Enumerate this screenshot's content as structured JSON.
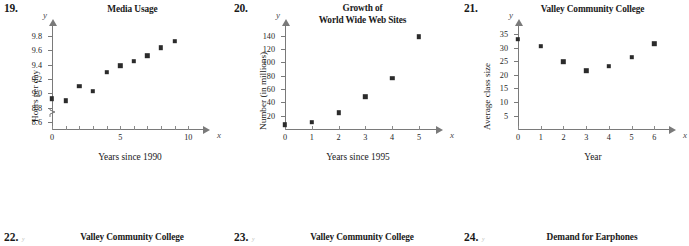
{
  "page": {
    "background": "#ffffff",
    "marker_color": "#2b2b2b",
    "axis_color": "#7a7a7a"
  },
  "problems": [
    {
      "number": "19.",
      "title_lines": [
        "Media Usage"
      ],
      "axis_x_letter": "x",
      "axis_y_letter": "y",
      "chart_data": {
        "type": "scatter",
        "title": "Media Usage",
        "xlabel": "Years since 1990",
        "ylabel": "Hours per day",
        "xlim": [
          0,
          11
        ],
        "ylim": [
          8.5,
          9.9
        ],
        "y_axis_break": true,
        "grid": false,
        "legend": "none",
        "xticks": [
          0,
          1,
          2,
          3,
          4,
          5,
          6,
          7,
          8,
          9,
          10
        ],
        "xtick_labels": [
          "0",
          "",
          "",
          "",
          "",
          "5",
          "",
          "",
          "",
          "",
          "10"
        ],
        "yticks": [
          8.6,
          8.8,
          9.0,
          9.2,
          9.4,
          9.6,
          9.8
        ],
        "ytick_labels": [
          "8.6",
          "8.8",
          "9.0",
          "9.2",
          "9.4",
          "9.6",
          "9.8"
        ],
        "x": [
          0,
          1,
          2,
          3,
          4,
          5,
          6,
          7,
          8,
          9
        ],
        "y": [
          8.94,
          8.91,
          9.11,
          9.04,
          9.31,
          9.4,
          9.46,
          9.54,
          9.65,
          9.74
        ]
      }
    },
    {
      "number": "20.",
      "title_lines": [
        "Growth of",
        "World Wide Web Sites"
      ],
      "axis_x_letter": "x",
      "axis_y_letter": "y",
      "chart_data": {
        "type": "scatter",
        "title": "Growth of World Wide Web Sites",
        "xlabel": "Years since 1995",
        "ylabel": "Number (in millions)",
        "xlim": [
          0,
          5.6
        ],
        "ylim": [
          0,
          150
        ],
        "y_axis_break": false,
        "grid": false,
        "legend": "none",
        "xticks": [
          0,
          1,
          2,
          3,
          4,
          5
        ],
        "xtick_labels": [
          "0",
          "1",
          "2",
          "3",
          "4",
          "5"
        ],
        "yticks": [
          20,
          40,
          60,
          80,
          100,
          120,
          140
        ],
        "ytick_labels": [
          "20",
          "40",
          "60",
          "80",
          "100",
          "120",
          "140"
        ],
        "x": [
          0,
          1,
          2,
          3,
          4,
          5
        ],
        "y": [
          8,
          12,
          26,
          50,
          78,
          140
        ]
      }
    },
    {
      "number": "21.",
      "title_lines": [
        "Valley Community College"
      ],
      "axis_x_letter": "x",
      "axis_y_letter": "y",
      "chart_data": {
        "type": "scatter",
        "title": "Valley Community College",
        "xlabel": "Year",
        "ylabel": "Average class size",
        "xlim": [
          0,
          6.6
        ],
        "ylim": [
          0,
          37
        ],
        "y_axis_break": false,
        "grid": false,
        "legend": "none",
        "xticks": [
          0,
          1,
          2,
          3,
          4,
          5,
          6
        ],
        "xtick_labels": [
          "0",
          "1",
          "2",
          "3",
          "4",
          "5",
          "6"
        ],
        "yticks": [
          5,
          10,
          15,
          20,
          25,
          30,
          35
        ],
        "ytick_labels": [
          "5",
          "10",
          "15",
          "20",
          "25",
          "30",
          "35"
        ],
        "x": [
          0,
          1,
          2,
          3,
          4,
          5,
          6
        ],
        "y": [
          33.5,
          31,
          25.3,
          22,
          23.6,
          27,
          32
        ]
      }
    }
  ],
  "bottom_row": [
    {
      "number": "22.",
      "title": "Valley Community College",
      "axis_hint": "y"
    },
    {
      "number": "23.",
      "title": "Valley Community College",
      "axis_hint": "y"
    },
    {
      "number": "24.",
      "title": "Demand for Earphones",
      "axis_hint": "y"
    }
  ]
}
